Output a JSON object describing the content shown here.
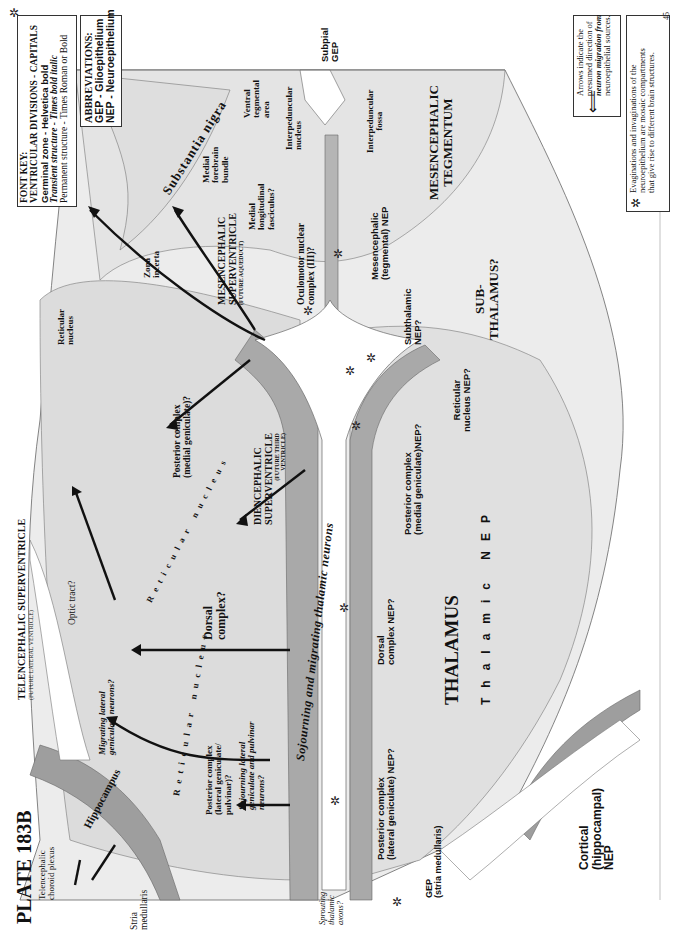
{
  "plate": {
    "title": "PLATE 183B",
    "page_number": "45"
  },
  "font_key": {
    "heading": "FONT KEY:",
    "lines": [
      "VENTRICULAR DIVISIONS - CAPITALS",
      "Germinal zone - Helvetica bold",
      "Transient structure - Times bold italic",
      "Permanent structure - Times Roman or Bold"
    ]
  },
  "abbreviations": {
    "heading": "ABBREVIATIONS:",
    "items": [
      "GEP - Glioepithelium",
      "NEP - Neuroepithelium"
    ]
  },
  "legend": {
    "arrow_note": [
      "Arrows indicate the",
      "presumed direction of",
      "neuron migration from",
      "neuroepithelial sources."
    ],
    "asterisk_note": [
      "Evaginations and invaginations of the",
      "neuroepithelium are mosaic compartments",
      "that give rise to different brain structures."
    ]
  },
  "labels": {
    "ventricular": {
      "telencephalic": "TELENCEPHALIC SUPERVENTRICLE",
      "telencephalic_sub": "(FUTURE LATERAL VENTRICLE)",
      "diencephalic_1": "DIENCEPHALIC",
      "diencephalic_2": "SUPERVENTRICLE",
      "diencephalic_sub1": "(FUTURE THIRD",
      "diencephalic_sub2": "VENTRICLE)",
      "mesencephalic_1": "MESENCEPHALIC",
      "mesencephalic_2": "SUPERVENTRICLE",
      "mesencephalic_sub": "(FUTURE AQUEDUCT)",
      "mes_tegmentum_1": "MESENCEPHALIC",
      "mes_tegmentum_2": "TEGMENTUM",
      "subthalamus_1": "SUB-",
      "subthalamus_2": "THALAMUS?",
      "thalamus": "THALAMUS"
    },
    "germinal": {
      "subpial_gep_1": "Subpial",
      "subpial_gep_2": "GEP",
      "mes_nep_1": "Mesencephalic",
      "mes_nep_2": "(tegmental) NEP",
      "subthalamic_nep_1": "Subthalamic",
      "subthalamic_nep_2": "NEP?",
      "reticular_nep_1": "Reticular",
      "reticular_nep_2": "nucleus NEP?",
      "post_medial_nep_1": "Posterior complex",
      "post_medial_nep_2": "(medial geniculate)NEP?",
      "thalamic_nep": "Thalamic NEP",
      "dorsal_nep_1": "Dorsal",
      "dorsal_nep_2": "complex NEP?",
      "post_lateral_nep_1": "Posterior complex",
      "post_lateral_nep_2": "(lateral geniculate) NEP?",
      "gep_stria_1": "GEP",
      "gep_stria_2": "(stria medullaris)",
      "cortical_nep_1": "Cortical",
      "cortical_nep_2": "(hippocampal)",
      "cortical_nep_3": "NEP"
    },
    "transient": {
      "sojourning_main": "Sojourning and migrating thalamic neurons",
      "migrating_lgn_1": "Migrating lateral",
      "migrating_lgn_2": "geniculate neurons?",
      "sojourning_lgn_1": "Sojourning lateral",
      "sojourning_lgn_2": "geniculate and pulvinar",
      "sojourning_lgn_3": "neurons?",
      "sprouting_1": "Sprouting",
      "sprouting_2": "thalamic",
      "sprouting_3": "axons?"
    },
    "permanent": {
      "substantia_nigra": "Substantia nigra",
      "ventral_tegmental_1": "Ventral",
      "ventral_tegmental_2": "tegmental",
      "ventral_tegmental_3": "area",
      "interpeduncular_nucleus_1": "Interpeduncular",
      "interpeduncular_nucleus_2": "nucleus",
      "interpeduncular_fossa_1": "Interpeduncular",
      "interpeduncular_fossa_2": "fossa",
      "medial_forebrain_1": "Medial",
      "medial_forebrain_2": "forebrain",
      "medial_forebrain_3": "bundle",
      "mlf_1": "Medial",
      "mlf_2": "longitudinal",
      "mlf_3": "fasciculus?",
      "oculomotor_1": "Oculomotor nuclear",
      "oculomotor_2": "complex (III)?",
      "zona_incerta_1": "Zona",
      "zona_incerta_2": "incerta",
      "reticular_nucleus_top_1": "Reticular",
      "reticular_nucleus_top_2": "nucleus",
      "post_medial_1": "Posterior complex",
      "post_medial_2": "(medial geniculate)?",
      "reticular_nucleus_arc": "Reticular nucleus",
      "reticular_nucleus_arc2": "Reticular nucleus",
      "dorsal_complex_1": "Dorsal",
      "dorsal_complex_2": "complex?",
      "optic_tract": "Optic tract?",
      "post_lateral_1": "Posterior complex",
      "post_lateral_2": "(lateral geniculate/",
      "post_lateral_3": "pulvinar)?",
      "hippocampus": "Hippocampus",
      "stria_1": "Stria",
      "stria_2": "medullaris",
      "choroid_1": "Telencephalic",
      "choroid_2": "choroid plexus"
    }
  },
  "colors": {
    "tissue_light": "#e9e9e9",
    "tissue_mid": "#d6d6d6",
    "nep_dark": "#a9a9a9",
    "outline": "#555555",
    "arrow": "#111111",
    "ventricle": "#ffffff"
  }
}
